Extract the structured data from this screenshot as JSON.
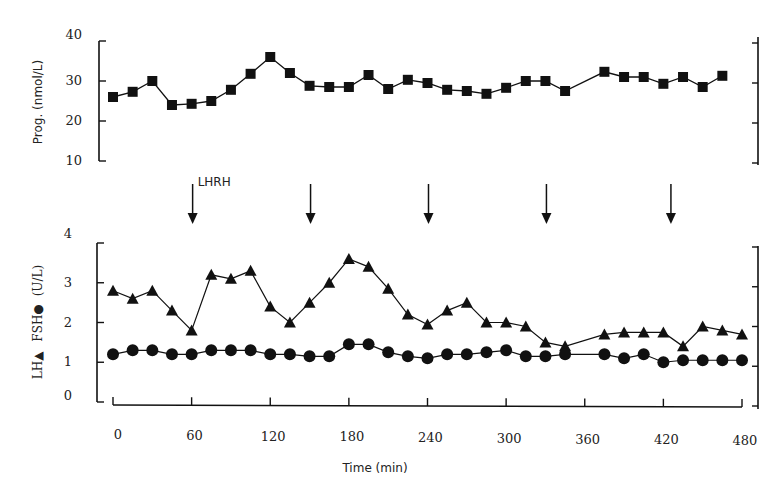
{
  "chart_data": [
    {
      "panel": "upper",
      "type": "line",
      "title": "",
      "xlabel": "",
      "ylabel": "Prog. (nmol/L)",
      "ylim": [
        10,
        40
      ],
      "yticks": [
        10,
        20,
        30,
        40
      ],
      "marker": "square",
      "series": [
        {
          "name": "Progesterone",
          "x": [
            0,
            15,
            30,
            45,
            60,
            75,
            90,
            105,
            120,
            135,
            150,
            165,
            180,
            195,
            210,
            225,
            240,
            255,
            270,
            285,
            300,
            315,
            330,
            345,
            375,
            390,
            405,
            420,
            435,
            450,
            465
          ],
          "values": [
            26,
            27.3,
            30,
            24,
            24.3,
            25,
            27.8,
            31.8,
            36,
            32,
            28.8,
            28.5,
            28.5,
            31.5,
            28,
            30.3,
            29.5,
            27.8,
            27.5,
            26.8,
            28.3,
            30,
            30,
            27.5,
            32.3,
            31,
            31,
            29.3,
            31,
            28.5,
            31.3
          ]
        }
      ]
    },
    {
      "panel": "lower",
      "type": "line",
      "title": "",
      "xlabel": "Time (min)",
      "ylabel": "LH▲ FSH● (U/L)",
      "xlim": [
        0,
        480
      ],
      "xticks": [
        0,
        60,
        120,
        180,
        240,
        300,
        360,
        420,
        480
      ],
      "ylim": [
        0,
        4
      ],
      "yticks": [
        0,
        1,
        2,
        3,
        4
      ],
      "series": [
        {
          "name": "LH",
          "marker": "triangle",
          "x": [
            0,
            15,
            30,
            45,
            60,
            75,
            90,
            105,
            120,
            135,
            150,
            165,
            180,
            195,
            210,
            225,
            240,
            255,
            270,
            285,
            300,
            315,
            330,
            345,
            375,
            390,
            405,
            420,
            435,
            450,
            465,
            480
          ],
          "values": [
            2.8,
            2.6,
            2.8,
            2.3,
            1.8,
            3.2,
            3.1,
            3.3,
            2.4,
            2.0,
            2.5,
            3.0,
            3.6,
            3.4,
            2.85,
            2.2,
            1.95,
            2.3,
            2.5,
            2.0,
            2.0,
            1.9,
            1.5,
            1.4,
            1.7,
            1.75,
            1.75,
            1.75,
            1.4,
            1.9,
            1.8,
            1.7
          ]
        },
        {
          "name": "FSH",
          "marker": "circle",
          "x": [
            0,
            15,
            30,
            45,
            60,
            75,
            90,
            105,
            120,
            135,
            150,
            165,
            180,
            195,
            210,
            225,
            240,
            255,
            270,
            285,
            300,
            315,
            330,
            345,
            375,
            390,
            405,
            420,
            435,
            450,
            465,
            480
          ],
          "values": [
            1.2,
            1.3,
            1.3,
            1.2,
            1.2,
            1.3,
            1.3,
            1.3,
            1.2,
            1.2,
            1.15,
            1.15,
            1.45,
            1.45,
            1.25,
            1.15,
            1.1,
            1.2,
            1.2,
            1.25,
            1.3,
            1.15,
            1.15,
            1.2,
            1.2,
            1.1,
            1.2,
            1.0,
            1.05,
            1.05,
            1.05,
            1.05
          ]
        }
      ],
      "annotations": {
        "label": "LHRH",
        "arrows_at": [
          60,
          150,
          240,
          330,
          425
        ]
      }
    }
  ],
  "labels": {
    "upper_ylabel": "Prog. (nmol/L)",
    "lower_ylabel_lh": "LH▲",
    "lower_ylabel_fsh": "FSH●",
    "lower_ylabel_unit": "(U/L)",
    "xlabel": "Time (min)",
    "lhrh": "LHRH"
  }
}
